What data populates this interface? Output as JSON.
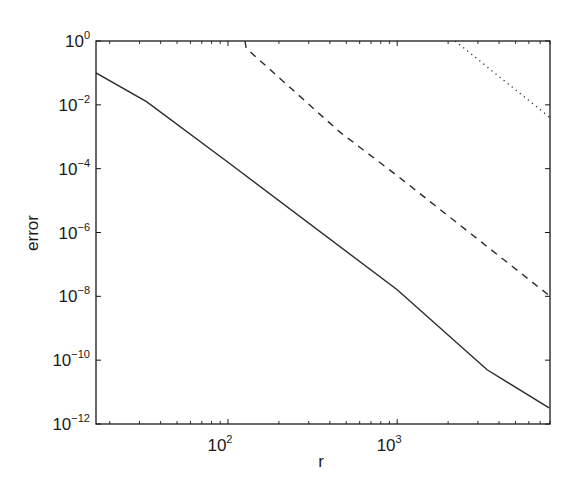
{
  "chart_data": {
    "type": "line",
    "title": "",
    "xlabel": "r",
    "ylabel": "error",
    "xscale": "log",
    "yscale": "log",
    "xlim": [
      16.6,
      8000
    ],
    "ylim": [
      1e-12,
      1
    ],
    "grid": false,
    "legend": null,
    "x_ticks": [
      {
        "value": 100,
        "label_base": "10",
        "label_exp": "2"
      },
      {
        "value": 1000,
        "label_base": "10",
        "label_exp": "3"
      }
    ],
    "y_ticks": [
      {
        "value": 1,
        "label_base": "10",
        "label_exp": "0"
      },
      {
        "value": 0.01,
        "label_base": "10",
        "label_exp": "-2"
      },
      {
        "value": 0.0001,
        "label_base": "10",
        "label_exp": "-4"
      },
      {
        "value": 1e-06,
        "label_base": "10",
        "label_exp": "-6"
      },
      {
        "value": 1e-08,
        "label_base": "10",
        "label_exp": "-8"
      },
      {
        "value": 1e-10,
        "label_base": "10",
        "label_exp": "-10"
      },
      {
        "value": 1e-12,
        "label_base": "10",
        "label_exp": "-12"
      }
    ],
    "series": [
      {
        "name": "solid",
        "style": "solid",
        "x": [
          16.6,
          33,
          100,
          1000,
          3400,
          7900
        ],
        "y": [
          0.1,
          0.0126,
          0.00016,
          1.6e-08,
          5e-11,
          3.2e-12
        ]
      },
      {
        "name": "dashed",
        "style": "dashed",
        "x": [
          126,
          128,
          455,
          1000,
          7900
        ],
        "y": [
          1.0,
          0.6,
          0.00145,
          6e-05,
          1.07e-08
        ]
      },
      {
        "name": "dotted",
        "style": "dotted",
        "x": [
          2200,
          7900
        ],
        "y": [
          1.0,
          0.0042
        ]
      }
    ]
  },
  "colors": {
    "line": "#2b2b2b",
    "axis": "#1a1a1a",
    "background": "#ffffff"
  }
}
